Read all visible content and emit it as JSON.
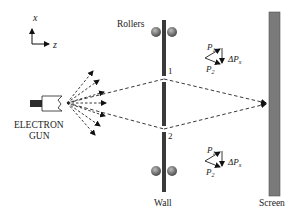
{
  "diagram": {
    "type": "double-slit electron experiment schematic",
    "axes": {
      "vertical_label": "x",
      "horizontal_label": "z"
    },
    "labels": {
      "rollers": "Rollers",
      "gun_line1": "ELECTRON",
      "gun_line2": "GUN",
      "wall": "Wall",
      "screen": "Screen",
      "slit1": "1",
      "slit2": "2"
    },
    "momentum_top": {
      "p1": "P",
      "p1_sub": "1",
      "p2": "P",
      "p2_sub": "2",
      "delta": "ΔP",
      "delta_sub": "x"
    },
    "momentum_bottom": {
      "p1": "P",
      "p1_sub": "1",
      "p2": "P",
      "p2_sub": "2",
      "delta": "ΔP",
      "delta_sub": "x"
    },
    "colors": {
      "wall": "#3a3a3a",
      "screen": "#7a7a7a",
      "roller": "#6e6e6e",
      "line": "#222222"
    }
  }
}
